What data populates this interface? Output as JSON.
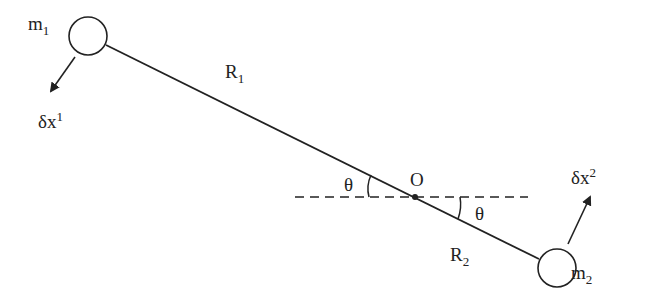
{
  "diagram": {
    "masses": [
      {
        "label": "m",
        "index": "1"
      },
      {
        "label": "m",
        "index": "2"
      }
    ],
    "radii": [
      {
        "label": "R",
        "index": "1"
      },
      {
        "label": "R",
        "index": "2"
      }
    ],
    "displacements": [
      {
        "label": "δx",
        "index": "1"
      },
      {
        "label": "δx",
        "index": "2"
      }
    ],
    "origin": "O",
    "angles": [
      "θ",
      "θ"
    ],
    "colors": {
      "stroke": "#222222",
      "background": "#ffffff"
    }
  }
}
